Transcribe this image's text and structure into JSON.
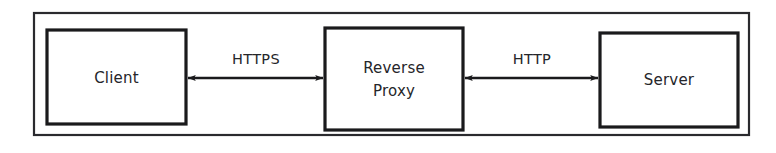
{
  "diagram": {
    "background_color": "#ffffff",
    "line_color": "#1a1a1c",
    "text_color": "#25262a",
    "frame": {
      "x": 34,
      "y": 13,
      "width": 715,
      "height": 122
    },
    "nodes": [
      {
        "id": "client",
        "label": "Client",
        "label_lines": [
          "Client"
        ],
        "x": 47,
        "y": 30,
        "width": 139,
        "height": 94
      },
      {
        "id": "reverse-proxy",
        "label": "Reverse Proxy",
        "label_lines": [
          "Reverse",
          "Proxy"
        ],
        "x": 325,
        "y": 28,
        "width": 138,
        "height": 102
      },
      {
        "id": "server",
        "label": "Server",
        "label_lines": [
          "Server"
        ],
        "x": 600,
        "y": 33,
        "width": 138,
        "height": 94
      }
    ],
    "edges": [
      {
        "id": "client-proxy",
        "label": "HTTPS",
        "from": "client",
        "to": "reverse-proxy",
        "x1": 188,
        "x2": 323,
        "y": 78,
        "arrow_start": true,
        "arrow_end": true,
        "label_x": 256,
        "label_y": 60
      },
      {
        "id": "proxy-server",
        "label": "HTTP",
        "from": "reverse-proxy",
        "to": "server",
        "x1": 465,
        "x2": 598,
        "y": 78,
        "arrow_start": true,
        "arrow_end": true,
        "label_x": 532,
        "label_y": 60
      }
    ]
  }
}
